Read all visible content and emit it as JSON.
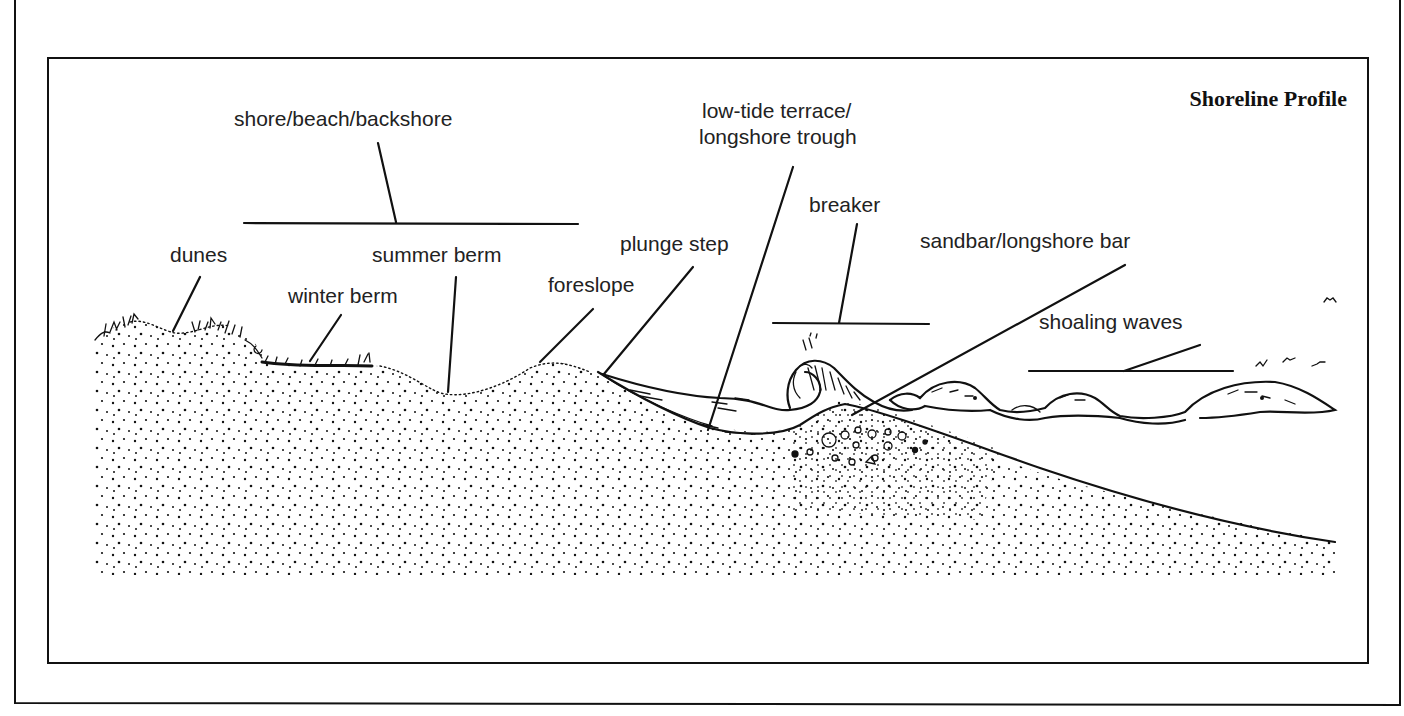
{
  "figure": {
    "title": "Shoreline Profile",
    "labels": {
      "shore": "shore/beach/backshore",
      "dunes": "dunes",
      "winter_berm": "winter berm",
      "summer_berm": "summer berm",
      "foreslope": "foreslope",
      "plunge_step": "plunge step",
      "low_tide_line1": "low-tide terrace/",
      "low_tide_line2": "longshore trough",
      "breaker": "breaker",
      "sandbar": "sandbar/longshore bar",
      "shoaling_waves": "shoaling waves"
    },
    "colors": {
      "ink": "#111111",
      "paper": "#ffffff"
    }
  }
}
